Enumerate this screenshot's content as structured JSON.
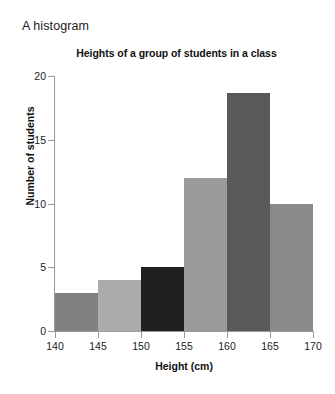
{
  "caption": "A histogram",
  "chart_data": {
    "type": "bar",
    "title": "Heights of a group of students in a class",
    "xlabel": "Height (cm)",
    "ylabel": "Number of students",
    "categories": [
      "140-145",
      "145-150",
      "150-155",
      "155-160",
      "160-165",
      "165-170"
    ],
    "bin_edges": [
      140,
      145,
      150,
      155,
      160,
      165,
      170
    ],
    "values": [
      3,
      4,
      5,
      12,
      18.7,
      10
    ],
    "bar_colors": [
      "#808080",
      "#ababab",
      "#1f1f1f",
      "#9b9b9b",
      "#5a5a5a",
      "#8a8a8a"
    ],
    "xlim": [
      140,
      170
    ],
    "ylim": [
      0,
      20
    ],
    "xticks": [
      140,
      145,
      150,
      155,
      160,
      165,
      170
    ],
    "yticks": [
      0,
      5,
      10,
      15,
      20
    ],
    "xtick_labels": [
      "140",
      "145",
      "150",
      "155",
      "160",
      "165",
      "170"
    ],
    "ytick_labels": [
      "0",
      "5",
      "10",
      "15",
      "20"
    ],
    "grid": false,
    "legend": null,
    "axis_color": "#9a9a9a"
  }
}
